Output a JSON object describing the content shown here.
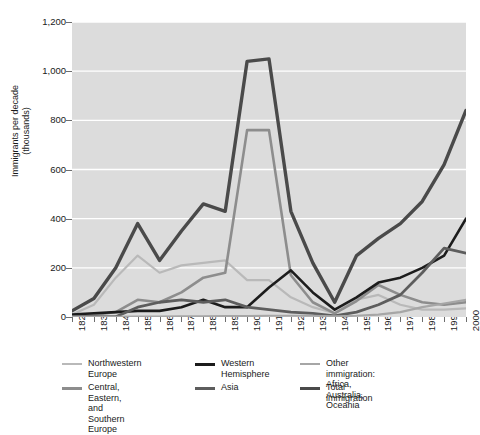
{
  "axes": {
    "ylabel": "Immigrants per decade\n(thousands)",
    "yticks": [
      "0",
      "200",
      "400",
      "600",
      "800",
      "1,000",
      "1,200"
    ],
    "xticks": [
      "1820",
      "1830",
      "1840",
      "1850",
      "1860",
      "1870",
      "1880",
      "1890",
      "1900",
      "1910",
      "1920",
      "1930",
      "1940",
      "1950",
      "1960",
      "1970",
      "1980",
      "1990",
      "2000"
    ]
  },
  "legend": {
    "items": [
      {
        "label": "Northwestern\nEurope",
        "color": "#b9b9b9",
        "width": 2.2,
        "col": 0,
        "row": 0
      },
      {
        "label": "Central, Eastern, and\nSouthern Europe",
        "color": "#8d8d8d",
        "width": 2.6,
        "col": 0,
        "row": 1
      },
      {
        "label": "Western\nHemisphere",
        "color": "#1c1c1c",
        "width": 2.6,
        "col": 1,
        "row": 0
      },
      {
        "label": "Asia",
        "color": "#5d5d5d",
        "width": 2.8,
        "col": 1,
        "row": 1
      },
      {
        "label": "Other immigration:\nAfrica, Australia, Oceania",
        "color": "#a6a6a6",
        "width": 2.2,
        "col": 2,
        "row": 0
      },
      {
        "label": "Total immigration",
        "color": "#4a4a4a",
        "width": 3.4,
        "col": 2,
        "row": 1
      }
    ]
  },
  "chart_data": {
    "type": "line",
    "title": "",
    "xlabel": "",
    "ylabel": "Immigrants per decade (thousands)",
    "xlim": [
      1820,
      2000
    ],
    "ylim": [
      0,
      1200
    ],
    "ytick_step": 200,
    "grid": "horizontal",
    "legend_position": "below",
    "plot_background": "#dcdcdc",
    "gridline_color": "#ffffff",
    "x": [
      1820,
      1830,
      1840,
      1850,
      1860,
      1870,
      1880,
      1890,
      1900,
      1910,
      1920,
      1930,
      1940,
      1950,
      1960,
      1970,
      1980,
      1990,
      2000
    ],
    "series": [
      {
        "name": "Northwestern Europe",
        "color": "#b9b9b9",
        "width": 2.2,
        "values": [
          10,
          50,
          160,
          250,
          180,
          210,
          220,
          230,
          150,
          150,
          80,
          40,
          15,
          70,
          90,
          50,
          30,
          30,
          35
        ]
      },
      {
        "name": "Central, Eastern, and Southern Europe",
        "color": "#8d8d8d",
        "width": 2.6,
        "values": [
          3,
          8,
          20,
          70,
          60,
          100,
          160,
          180,
          760,
          760,
          170,
          60,
          15,
          65,
          130,
          90,
          60,
          50,
          60
        ]
      },
      {
        "name": "Western Hemisphere",
        "color": "#1c1c1c",
        "width": 2.6,
        "values": [
          10,
          15,
          20,
          25,
          25,
          40,
          70,
          40,
          40,
          120,
          190,
          100,
          30,
          80,
          140,
          160,
          200,
          250,
          400
        ]
      },
      {
        "name": "Asia",
        "color": "#5d5d5d",
        "width": 2.8,
        "values": [
          1,
          1,
          1,
          40,
          60,
          70,
          60,
          70,
          40,
          30,
          20,
          15,
          5,
          20,
          50,
          90,
          180,
          280,
          260
        ]
      },
      {
        "name": "Other immigration: Africa, Australia, Oceania",
        "color": "#a6a6a6",
        "width": 2.2,
        "values": [
          1,
          1,
          1,
          2,
          2,
          3,
          3,
          4,
          4,
          5,
          5,
          5,
          3,
          5,
          10,
          20,
          40,
          55,
          70
        ]
      },
      {
        "name": "Total immigration",
        "color": "#4a4a4a",
        "width": 3.4,
        "values": [
          25,
          75,
          200,
          380,
          230,
          350,
          460,
          430,
          1040,
          1050,
          430,
          220,
          60,
          250,
          320,
          380,
          470,
          620,
          840
        ]
      }
    ]
  }
}
